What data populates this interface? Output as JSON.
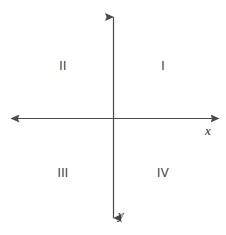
{
  "figure": {
    "type": "cartesian-coordinate-plane",
    "background_color": "#ffffff",
    "line_color": "#4a4a4a",
    "text_color": "#3a3a3a",
    "width": 226,
    "height": 235
  },
  "axes": {
    "origin": {
      "x": 113,
      "y": 118
    },
    "x_axis": {
      "label": "x",
      "start": {
        "x": 10,
        "y": 118
      },
      "end": {
        "x": 220,
        "y": 118
      },
      "arrow_start": true,
      "arrow_end": true
    },
    "y_axis": {
      "label": "y",
      "start": {
        "x": 113,
        "y": 16
      },
      "end": {
        "x": 113,
        "y": 219
      },
      "arrow_start": true,
      "arrow_end": true
    }
  },
  "quadrants": [
    {
      "id": "quadrant-1",
      "label": "I"
    },
    {
      "id": "quadrant-2",
      "label": "II"
    },
    {
      "id": "quadrant-3",
      "label": "III"
    },
    {
      "id": "quadrant-4",
      "label": "IV"
    }
  ]
}
